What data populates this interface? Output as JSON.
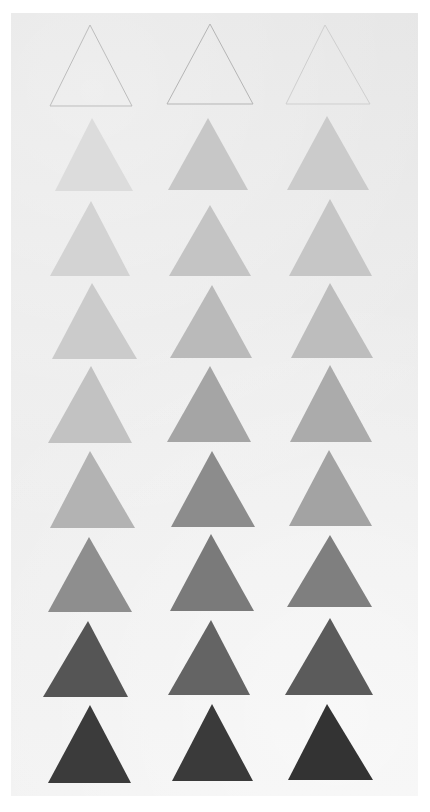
{
  "artwork": {
    "description": "Grayscale value study: grid of painted triangles on paper, 3 columns x 9 rows, top row outlined only, progressing light to dark",
    "paper": {
      "color": "#e9e9e9",
      "x": 11,
      "y": 13,
      "width": 407,
      "height": 783
    },
    "columns": 3,
    "rows": [
      {
        "row": 1,
        "style": "outline",
        "triangles": [
          {
            "apex": [
              90,
              25
            ],
            "base_y": 106,
            "left": 50,
            "right": 132,
            "fill": "none",
            "stroke": "#bdbdbd"
          },
          {
            "apex": [
              210,
              24
            ],
            "base_y": 104,
            "left": 167,
            "right": 253,
            "fill": "none",
            "stroke": "#b5b5b5"
          },
          {
            "apex": [
              325,
              25
            ],
            "base_y": 104,
            "left": 286,
            "right": 370,
            "fill": "none",
            "stroke": "#cfcfcf"
          }
        ]
      },
      {
        "row": 2,
        "style": "fill",
        "triangles": [
          {
            "apex": [
              92,
              118
            ],
            "base_y": 191,
            "left": 55,
            "right": 133,
            "fill": "#dcdcdc"
          },
          {
            "apex": [
              208,
              118
            ],
            "base_y": 190,
            "left": 168,
            "right": 248,
            "fill": "#c7c7c7"
          },
          {
            "apex": [
              327,
              116
            ],
            "base_y": 190,
            "left": 287,
            "right": 369,
            "fill": "#cbcbcb"
          }
        ]
      },
      {
        "row": 3,
        "style": "fill",
        "triangles": [
          {
            "apex": [
              91,
              201
            ],
            "base_y": 276,
            "left": 50,
            "right": 130,
            "fill": "#d3d3d3"
          },
          {
            "apex": [
              210,
              205
            ],
            "base_y": 276,
            "left": 169,
            "right": 251,
            "fill": "#c4c4c4"
          },
          {
            "apex": [
              330,
              199
            ],
            "base_y": 276,
            "left": 289,
            "right": 372,
            "fill": "#c6c6c6"
          }
        ]
      },
      {
        "row": 4,
        "style": "fill",
        "triangles": [
          {
            "apex": [
              92,
              283
            ],
            "base_y": 359,
            "left": 52,
            "right": 137,
            "fill": "#cbcbcb"
          },
          {
            "apex": [
              212,
              285
            ],
            "base_y": 358,
            "left": 170,
            "right": 252,
            "fill": "#bababa"
          },
          {
            "apex": [
              330,
              283
            ],
            "base_y": 358,
            "left": 291,
            "right": 373,
            "fill": "#bdbdbd"
          }
        ]
      },
      {
        "row": 5,
        "style": "fill",
        "triangles": [
          {
            "apex": [
              91,
              366
            ],
            "base_y": 443,
            "left": 48,
            "right": 132,
            "fill": "#c2c2c2"
          },
          {
            "apex": [
              210,
              366
            ],
            "base_y": 442,
            "left": 167,
            "right": 251,
            "fill": "#a5a5a5"
          },
          {
            "apex": [
              330,
              365
            ],
            "base_y": 442,
            "left": 290,
            "right": 372,
            "fill": "#ababab"
          }
        ]
      },
      {
        "row": 6,
        "style": "fill",
        "triangles": [
          {
            "apex": [
              90,
              451
            ],
            "base_y": 528,
            "left": 50,
            "right": 135,
            "fill": "#b3b3b3"
          },
          {
            "apex": [
              212,
              451
            ],
            "base_y": 527,
            "left": 171,
            "right": 255,
            "fill": "#8c8c8c"
          },
          {
            "apex": [
              329,
              450
            ],
            "base_y": 526,
            "left": 289,
            "right": 372,
            "fill": "#a3a3a3"
          }
        ]
      },
      {
        "row": 7,
        "style": "fill",
        "triangles": [
          {
            "apex": [
              89,
              537
            ],
            "base_y": 612,
            "left": 48,
            "right": 132,
            "fill": "#8e8e8e"
          },
          {
            "apex": [
              211,
              534
            ],
            "base_y": 611,
            "left": 170,
            "right": 254,
            "fill": "#7a7a7a"
          },
          {
            "apex": [
              330,
              535
            ],
            "base_y": 607,
            "left": 287,
            "right": 372,
            "fill": "#7f7f7f"
          }
        ]
      },
      {
        "row": 8,
        "style": "fill",
        "triangles": [
          {
            "apex": [
              88,
              621
            ],
            "base_y": 697,
            "left": 43,
            "right": 128,
            "fill": "#555555"
          },
          {
            "apex": [
              211,
              620
            ],
            "base_y": 695,
            "left": 168,
            "right": 250,
            "fill": "#646464"
          },
          {
            "apex": [
              330,
              618
            ],
            "base_y": 695,
            "left": 285,
            "right": 373,
            "fill": "#5b5b5b"
          }
        ]
      },
      {
        "row": 9,
        "style": "fill",
        "triangles": [
          {
            "apex": [
              90,
              705
            ],
            "base_y": 783,
            "left": 48,
            "right": 131,
            "fill": "#3b3b3b"
          },
          {
            "apex": [
              212,
              704
            ],
            "base_y": 781,
            "left": 172,
            "right": 253,
            "fill": "#3a3a3a"
          },
          {
            "apex": [
              327,
              704
            ],
            "base_y": 780,
            "left": 288,
            "right": 373,
            "fill": "#333333"
          }
        ]
      }
    ]
  }
}
